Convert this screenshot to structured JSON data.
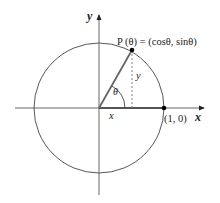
{
  "diagram": {
    "axes": {
      "x_label": "x",
      "y_label": "y"
    },
    "labels": {
      "point_p": "P (θ) = (cosθ, sinθ)",
      "point_one_zero": "(1, 0)",
      "angle": "θ",
      "x_leg": "x",
      "y_leg": "y"
    },
    "colors": {
      "circle": "#444444",
      "axes": "#555555",
      "radius": "#666666",
      "point": "#000000",
      "text": "#222222"
    }
  }
}
